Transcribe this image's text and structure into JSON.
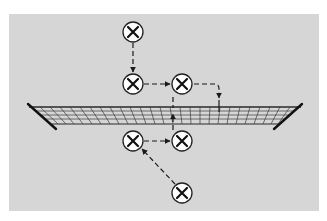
{
  "diagram": {
    "title": "Volleyball player movement drill",
    "colors": {
      "background": "#ffffff",
      "court": "#d6d6d6",
      "net_lines": "#2a2a2a",
      "node_fill": "#ffffff",
      "node_stroke": "#222222",
      "arrow": "#1a1a1a"
    },
    "nodes": [
      {
        "id": "A",
        "icon": "player-x-icon",
        "x": 133,
        "y": 32
      },
      {
        "id": "B",
        "icon": "player-x-icon",
        "x": 133,
        "y": 84
      },
      {
        "id": "C",
        "icon": "player-x-icon",
        "x": 182,
        "y": 84
      },
      {
        "id": "D",
        "icon": "player-x-icon",
        "x": 133,
        "y": 141
      },
      {
        "id": "E",
        "icon": "player-x-icon",
        "x": 182,
        "y": 141
      },
      {
        "id": "F",
        "icon": "player-x-icon",
        "x": 182,
        "y": 193
      }
    ],
    "edges": [
      {
        "from": "A",
        "to": "B",
        "style": "dashed-arrow"
      },
      {
        "from": "B",
        "to": "C",
        "style": "dashed-arrow"
      },
      {
        "from": "C",
        "to": "net",
        "style": "dashed-arrow-corner"
      },
      {
        "from": "F",
        "to": "D",
        "style": "dashed-arrow"
      },
      {
        "from": "D",
        "to": "E",
        "style": "dashed-arrow"
      },
      {
        "from": "E",
        "to": "net",
        "style": "dashed-arrow"
      }
    ],
    "net": {
      "label": "net",
      "icon": "volleyball-net-icon"
    }
  }
}
